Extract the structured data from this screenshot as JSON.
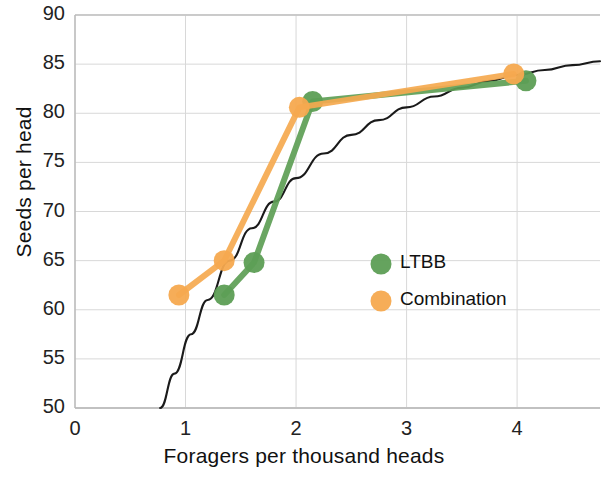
{
  "chart_data": {
    "type": "scatter",
    "title": "",
    "xlabel": "Foragers per thousand heads",
    "ylabel": "Seeds per head",
    "xlim": [
      0,
      4.75
    ],
    "ylim": [
      50,
      90
    ],
    "xticks": [
      "0",
      "1",
      "2",
      "3",
      "4"
    ],
    "xtick_values": [
      0,
      1,
      2,
      3,
      4
    ],
    "yticks": [
      "50",
      "55",
      "60",
      "65",
      "70",
      "75",
      "80",
      "85",
      "90"
    ],
    "ytick_values": [
      50,
      55,
      60,
      65,
      70,
      75,
      80,
      85,
      90
    ],
    "grid": true,
    "legend_position": "center-right",
    "series": [
      {
        "name": "LTBB",
        "color": "#5d9e55",
        "marker": "circle",
        "line": true,
        "points": [
          {
            "x": 1.35,
            "y": 61.5
          },
          {
            "x": 1.62,
            "y": 64.8
          },
          {
            "x": 2.15,
            "y": 81.2
          },
          {
            "x": 4.08,
            "y": 83.3
          }
        ]
      },
      {
        "name": "Combination",
        "color": "#f4a council",
        "marker": "circle",
        "line": true,
        "points": [
          {
            "x": 0.94,
            "y": 61.5
          },
          {
            "x": 1.35,
            "y": 65.0
          },
          {
            "x": 2.03,
            "y": 80.6
          },
          {
            "x": 3.97,
            "y": 84.0
          }
        ]
      }
    ],
    "fit_curve": {
      "name": "fitted-curve",
      "color": "#1a1a1a",
      "points": [
        {
          "x": 0.77,
          "y": 50.0
        },
        {
          "x": 0.9,
          "y": 53.5
        },
        {
          "x": 1.05,
          "y": 57.5
        },
        {
          "x": 1.2,
          "y": 61.0
        },
        {
          "x": 1.4,
          "y": 65.0
        },
        {
          "x": 1.6,
          "y": 68.3
        },
        {
          "x": 1.8,
          "y": 71.0
        },
        {
          "x": 2.0,
          "y": 73.4
        },
        {
          "x": 2.25,
          "y": 75.9
        },
        {
          "x": 2.5,
          "y": 77.8
        },
        {
          "x": 2.75,
          "y": 79.3
        },
        {
          "x": 3.0,
          "y": 80.6
        },
        {
          "x": 3.25,
          "y": 81.7
        },
        {
          "x": 3.5,
          "y": 82.6
        },
        {
          "x": 3.75,
          "y": 83.3
        },
        {
          "x": 4.0,
          "y": 83.9
        },
        {
          "x": 4.25,
          "y": 84.4
        },
        {
          "x": 4.5,
          "y": 84.9
        },
        {
          "x": 4.75,
          "y": 85.3
        }
      ]
    }
  },
  "axes": {
    "x_title": "Foragers per thousand heads",
    "y_title": "Seeds per head"
  },
  "legend": {
    "entries": [
      {
        "label": "LTBB",
        "color": "#5d9e55"
      },
      {
        "label": "Combination",
        "color": "#f5a94f"
      }
    ]
  },
  "colors": {
    "ltbb": "#5d9e55",
    "combination": "#f5a94f",
    "curve": "#1a1a1a",
    "grid": "#d8d8d8",
    "axis": "#b9b9b9",
    "text": "#1a1a1a",
    "background": "#ffffff"
  }
}
